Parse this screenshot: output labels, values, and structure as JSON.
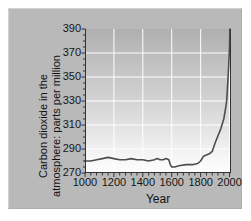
{
  "figure": {
    "background_color": "#ffffff",
    "panel_color": "#b9b9b9",
    "line_color": "#4d4d4d",
    "grid_color": "#ffffff",
    "axis_color": "#333333",
    "text_color": "#111111"
  },
  "chart_data": {
    "type": "line",
    "title": "",
    "subtitle": "",
    "xlabel": "Year",
    "ylabel": "Carbon dioxide in the atmosphere: parts per million",
    "ylabel_lines": [
      "Carbon dioxide in the",
      "atmosphere: parts per million"
    ],
    "xlim": [
      1000,
      2010
    ],
    "ylim": [
      270,
      390
    ],
    "xticks": [
      1000,
      1200,
      1400,
      1600,
      1800,
      2000
    ],
    "xtick_labels": [
      "1000",
      "1200",
      "1400",
      "1600",
      "1800",
      "2000"
    ],
    "yticks": [
      270,
      290,
      310,
      330,
      350,
      370,
      390
    ],
    "ytick_labels": [
      "270",
      "290",
      "310",
      "330",
      "350",
      "370",
      "390"
    ],
    "x_minor_tick_step": 40,
    "grid": true,
    "grid_axes": "both",
    "legend": false,
    "legend_position": "none",
    "series": [
      {
        "name": "Atmospheric CO2",
        "x": [
          1000,
          1040,
          1080,
          1120,
          1160,
          1200,
          1240,
          1280,
          1320,
          1360,
          1400,
          1440,
          1480,
          1500,
          1520,
          1540,
          1560,
          1580,
          1590,
          1600,
          1620,
          1650,
          1700,
          1750,
          1780,
          1800,
          1820,
          1840,
          1860,
          1880,
          1900,
          1920,
          1940,
          1950,
          1960,
          1970,
          1980,
          1990,
          1995,
          2000,
          2002
        ],
        "y": [
          280,
          280,
          281,
          282,
          283,
          282,
          281,
          281,
          282,
          281,
          281,
          280,
          281,
          282,
          281,
          281,
          282,
          281,
          277,
          275,
          275,
          276,
          277,
          277,
          278,
          280,
          284,
          285,
          286,
          288,
          295,
          301,
          307,
          311,
          315,
          322,
          330,
          350,
          362,
          375,
          390
        ],
        "color": "#4d4d4d",
        "line_width": 1.6
      }
    ]
  }
}
